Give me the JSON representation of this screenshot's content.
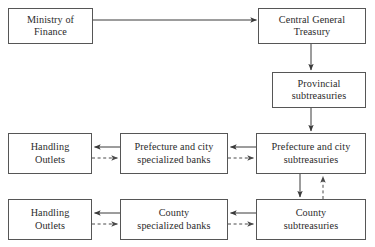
{
  "diagram": {
    "colors": {
      "box_border": "#565656",
      "text": "#2b2b2b",
      "solid_edge": "#3a3a3a",
      "dashed_edge": "#4a4a4a",
      "background": "#ffffff"
    },
    "nodes": [
      {
        "id": "ministry-of-finance",
        "label": "Ministry of\nFinance",
        "x": 8,
        "y": 8,
        "w": 85,
        "h": 36
      },
      {
        "id": "central-general-treasury",
        "label": "Central General\nTreasury",
        "x": 258,
        "y": 8,
        "w": 108,
        "h": 36
      },
      {
        "id": "provincial-subtreasuries",
        "label": "Provincial\nsubtreasuries",
        "x": 272,
        "y": 72,
        "w": 94,
        "h": 36
      },
      {
        "id": "handling-outlets-prefecture",
        "label": "Handling\nOutlets",
        "x": 8,
        "y": 133,
        "w": 84,
        "h": 41
      },
      {
        "id": "prefecture-city-specialized-banks",
        "label": "Prefecture and city\nspecialized banks",
        "x": 120,
        "y": 133,
        "w": 108,
        "h": 41
      },
      {
        "id": "prefecture-city-subtreasuries",
        "label": "Prefecture and city\nsubtreasuries",
        "x": 256,
        "y": 133,
        "w": 110,
        "h": 41
      },
      {
        "id": "handling-outlets-county",
        "label": "Handling\nOutlets",
        "x": 8,
        "y": 199,
        "w": 84,
        "h": 41
      },
      {
        "id": "county-specialized-banks",
        "label": "County\nspecialized banks",
        "x": 120,
        "y": 199,
        "w": 108,
        "h": 41
      },
      {
        "id": "county-subtreasuries",
        "label": "County\nsubtreasuries",
        "x": 256,
        "y": 199,
        "w": 110,
        "h": 41
      }
    ],
    "edges": [
      {
        "id": "ministry-to-central",
        "from": "ministry-of-finance",
        "to": "central-general-treasury",
        "style": "solid",
        "direction": "right"
      },
      {
        "id": "central-to-provincial",
        "from": "central-general-treasury",
        "to": "provincial-subtreasuries",
        "style": "solid",
        "direction": "down"
      },
      {
        "id": "provincial-to-prefecture",
        "from": "provincial-subtreasuries",
        "to": "prefecture-city-subtreasuries",
        "style": "solid",
        "direction": "down"
      },
      {
        "id": "prefecture-sub-to-banks",
        "from": "prefecture-city-subtreasuries",
        "to": "prefecture-city-specialized-banks",
        "style": "solid",
        "direction": "left"
      },
      {
        "id": "prefecture-banks-to-sub",
        "from": "prefecture-city-specialized-banks",
        "to": "prefecture-city-subtreasuries",
        "style": "dashed",
        "direction": "right"
      },
      {
        "id": "prefecture-banks-to-outlets",
        "from": "prefecture-city-specialized-banks",
        "to": "handling-outlets-prefecture",
        "style": "solid",
        "direction": "left"
      },
      {
        "id": "prefecture-outlets-to-banks",
        "from": "handling-outlets-prefecture",
        "to": "prefecture-city-specialized-banks",
        "style": "dashed",
        "direction": "right"
      },
      {
        "id": "prefecture-sub-to-county-sub",
        "from": "prefecture-city-subtreasuries",
        "to": "county-subtreasuries",
        "style": "solid",
        "direction": "down"
      },
      {
        "id": "county-sub-to-prefecture-sub",
        "from": "county-subtreasuries",
        "to": "prefecture-city-subtreasuries",
        "style": "dashed",
        "direction": "up"
      },
      {
        "id": "county-sub-to-banks",
        "from": "county-subtreasuries",
        "to": "county-specialized-banks",
        "style": "solid",
        "direction": "left"
      },
      {
        "id": "county-banks-to-sub",
        "from": "county-specialized-banks",
        "to": "county-subtreasuries",
        "style": "dashed",
        "direction": "right"
      },
      {
        "id": "county-banks-to-outlets",
        "from": "county-specialized-banks",
        "to": "handling-outlets-county",
        "style": "solid",
        "direction": "left"
      },
      {
        "id": "county-outlets-to-banks",
        "from": "handling-outlets-county",
        "to": "county-specialized-banks",
        "style": "dashed",
        "direction": "right"
      }
    ]
  }
}
